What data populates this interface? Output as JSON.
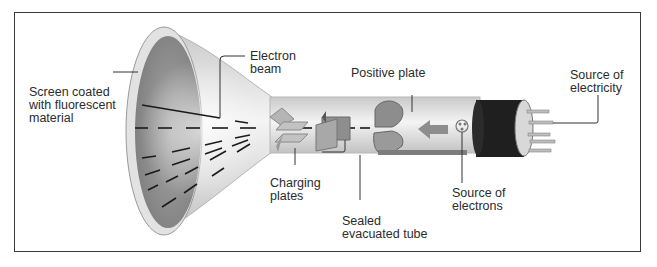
{
  "diagram": {
    "labels": {
      "screen": [
        "Screen coated",
        "with fluorescent",
        "material"
      ],
      "electron_beam": [
        "Electron",
        "beam"
      ],
      "positive_plate": [
        "Positive plate"
      ],
      "source_electricity": [
        "Source of",
        "electricity"
      ],
      "charging_plates": [
        "Charging",
        "plates"
      ],
      "source_electrons": [
        "Source of",
        "electrons"
      ],
      "sealed_tube": [
        "Sealed",
        "evacuated tube"
      ]
    },
    "colors": {
      "frame": "#3a3a3a",
      "screen": "#8f8f8f",
      "glass": "#dcdcdc",
      "plate": "#8a8a8a",
      "base": "#1e1e1e",
      "text": "#2b2b2b"
    }
  }
}
